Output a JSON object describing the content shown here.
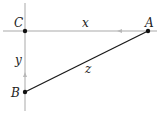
{
  "diagram": {
    "type": "right-triangle-related-rates",
    "colors": {
      "axis": "#a9a9a9",
      "arrow": "#b8b8b8",
      "segment": "#1a1a1a",
      "point": "#111111",
      "label": "#222222"
    },
    "points": [
      {
        "id": "C",
        "label": "C",
        "x": 25,
        "y": 31
      },
      {
        "id": "A",
        "label": "A",
        "x": 148,
        "y": 31
      },
      {
        "id": "B",
        "label": "B",
        "x": 25,
        "y": 92
      }
    ],
    "edge_labels": {
      "x": "x",
      "y": "y",
      "z": "z"
    },
    "axes": {
      "horizontal": {
        "x1": 3,
        "y1": 31,
        "x2": 157,
        "y2": 31
      },
      "vertical": {
        "x1": 25,
        "y1": 3,
        "x2": 25,
        "y2": 111
      }
    },
    "arrows": [
      {
        "on": "x",
        "direction": "left",
        "x": 120,
        "y": 31
      },
      {
        "on": "y",
        "direction": "up",
        "x": 25,
        "y": 75
      }
    ]
  }
}
